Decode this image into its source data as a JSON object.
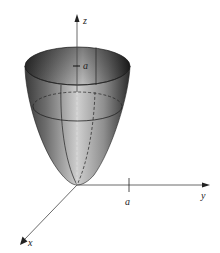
{
  "figure": {
    "type": "3d-surface-plot",
    "surface": "paraboloid",
    "axes": {
      "z_label": "z",
      "y_label": "y",
      "x_label": "x"
    },
    "tick_labels": {
      "z_tick": "a",
      "y_tick": "a"
    },
    "colors": {
      "surface_dark": "#2e2e2e",
      "surface_mid": "#8a8a8a",
      "surface_light": "#d4d4d4",
      "axis": "#333333",
      "background": "#ffffff"
    }
  }
}
